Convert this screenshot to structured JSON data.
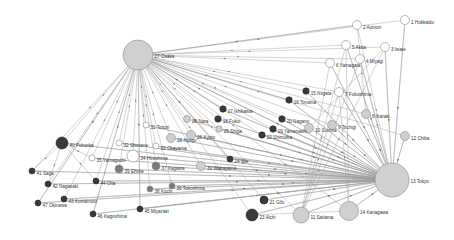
{
  "diagram": {
    "type": "network-graph",
    "colors": {
      "dark": "#3a3a3a",
      "medium": "#7a7a7a",
      "light": "#cfcfcf",
      "white": "#ffffff",
      "stroke": "#8a8a8a",
      "edge": "#9a9a9a"
    },
    "nodes": [
      {
        "id": 1,
        "label": "1 Hokkaido",
        "x": 405,
        "y": 20,
        "r": 4.5,
        "fill": "white"
      },
      {
        "id": 2,
        "label": "2 Aomori",
        "x": 357,
        "y": 25,
        "r": 4.5,
        "fill": "white"
      },
      {
        "id": 3,
        "label": "3 Iwate",
        "x": 385,
        "y": 47,
        "r": 4.5,
        "fill": "white"
      },
      {
        "id": 4,
        "label": "4 Miyagi",
        "x": 360,
        "y": 59,
        "r": 4.5,
        "fill": "white"
      },
      {
        "id": 5,
        "label": "5 Akita",
        "x": 346,
        "y": 45,
        "r": 4.5,
        "fill": "white"
      },
      {
        "id": 6,
        "label": "6 Yamagata",
        "x": 330,
        "y": 63,
        "r": 4.5,
        "fill": "white"
      },
      {
        "id": 7,
        "label": "7 Fukushima",
        "x": 339,
        "y": 92,
        "r": 4.5,
        "fill": "white"
      },
      {
        "id": 8,
        "label": "8 Ibaraki",
        "x": 366,
        "y": 114,
        "r": 4.5,
        "fill": "light"
      },
      {
        "id": 9,
        "label": "9 Tochigi",
        "x": 332,
        "y": 125,
        "r": 4.5,
        "fill": "light"
      },
      {
        "id": 10,
        "label": "10 Gunma",
        "x": 309,
        "y": 128,
        "r": 4.5,
        "fill": "light"
      },
      {
        "id": 11,
        "label": "11 Saitama",
        "x": 301,
        "y": 215,
        "r": 8,
        "fill": "light"
      },
      {
        "id": 12,
        "label": "12 Chiba",
        "x": 405,
        "y": 136,
        "r": 4.5,
        "fill": "light"
      },
      {
        "id": 13,
        "label": "13 Tokyo",
        "x": 392,
        "y": 180,
        "r": 17,
        "fill": "light"
      },
      {
        "id": 14,
        "label": "14 Kanagawa",
        "x": 349,
        "y": 211,
        "r": 9.5,
        "fill": "light"
      },
      {
        "id": 15,
        "label": "15 Niigata",
        "x": 306,
        "y": 91,
        "r": 3.2,
        "fill": "dark"
      },
      {
        "id": 16,
        "label": "16 Toyama",
        "x": 289,
        "y": 100,
        "r": 3.2,
        "fill": "dark"
      },
      {
        "id": 17,
        "label": "17 Ishikawa",
        "x": 223,
        "y": 109,
        "r": 3.2,
        "fill": "dark"
      },
      {
        "id": 18,
        "label": "18 Fukui",
        "x": 218,
        "y": 119,
        "r": 3.2,
        "fill": "dark"
      },
      {
        "id": 19,
        "label": "19 Yamanashi",
        "x": 273,
        "y": 129,
        "r": 3.2,
        "fill": "dark"
      },
      {
        "id": 20,
        "label": "20 Nagano",
        "x": 282,
        "y": 119,
        "r": 3.2,
        "fill": "dark"
      },
      {
        "id": 21,
        "label": "21 Gifu",
        "x": 264,
        "y": 200,
        "r": 4,
        "fill": "dark"
      },
      {
        "id": 22,
        "label": "22 Shizuoka",
        "x": 262,
        "y": 135,
        "r": 3.2,
        "fill": "dark"
      },
      {
        "id": 23,
        "label": "23 Aichi",
        "x": 252,
        "y": 215,
        "r": 6,
        "fill": "dark"
      },
      {
        "id": 24,
        "label": "24 Mie",
        "x": 230,
        "y": 159,
        "r": 3,
        "fill": "dark"
      },
      {
        "id": 25,
        "label": "25 Shiga",
        "x": 219,
        "y": 129,
        "r": 3.2,
        "fill": "light"
      },
      {
        "id": 26,
        "label": "26 Kyoto",
        "x": 191,
        "y": 135,
        "r": 4.5,
        "fill": "light"
      },
      {
        "id": 27,
        "label": "27 Osaka",
        "x": 138,
        "y": 55,
        "r": 15,
        "fill": "light"
      },
      {
        "id": 28,
        "label": "28 Hyogo",
        "x": 171,
        "y": 138,
        "r": 4.5,
        "fill": "light"
      },
      {
        "id": 29,
        "label": "29 Nara",
        "x": 187,
        "y": 119,
        "r": 3.5,
        "fill": "light"
      },
      {
        "id": 30,
        "label": "30 Wakayama",
        "x": 201,
        "y": 166,
        "r": 4.5,
        "fill": "light"
      },
      {
        "id": 31,
        "label": "31 Tottori",
        "x": 146,
        "y": 125,
        "r": 3,
        "fill": "white"
      },
      {
        "id": 32,
        "label": "32 Shimane",
        "x": 119,
        "y": 143,
        "r": 3,
        "fill": "white"
      },
      {
        "id": 33,
        "label": "33 Okayama",
        "x": 156,
        "y": 146,
        "r": 3,
        "fill": "white"
      },
      {
        "id": 34,
        "label": "34 Hiroshima",
        "x": 133,
        "y": 156,
        "r": 6,
        "fill": "white"
      },
      {
        "id": 35,
        "label": "35 Yamaguchi",
        "x": 92,
        "y": 158,
        "r": 3,
        "fill": "white"
      },
      {
        "id": 36,
        "label": "36 Tokushima",
        "x": 172,
        "y": 186,
        "r": 3,
        "fill": "medium"
      },
      {
        "id": 37,
        "label": "37 Kagawa",
        "x": 156,
        "y": 166,
        "r": 4,
        "fill": "medium"
      },
      {
        "id": 38,
        "label": "38 Kochi",
        "x": 150,
        "y": 189,
        "r": 3,
        "fill": "medium"
      },
      {
        "id": 39,
        "label": "39 Ehime",
        "x": 119,
        "y": 169,
        "r": 4,
        "fill": "medium"
      },
      {
        "id": 40,
        "label": "40 Fukuoka",
        "x": 62,
        "y": 143,
        "r": 6,
        "fill": "dark"
      },
      {
        "id": 41,
        "label": "41 Saga",
        "x": 32,
        "y": 171,
        "r": 3,
        "fill": "dark"
      },
      {
        "id": 42,
        "label": "42 Nagasaki",
        "x": 48,
        "y": 184,
        "r": 3,
        "fill": "dark"
      },
      {
        "id": 43,
        "label": "43 Kumamoto",
        "x": 64,
        "y": 199,
        "r": 3,
        "fill": "dark"
      },
      {
        "id": 44,
        "label": "44 Oita",
        "x": 96,
        "y": 181,
        "r": 3,
        "fill": "dark"
      },
      {
        "id": 45,
        "label": "45 Miyazaki",
        "x": 140,
        "y": 209,
        "r": 3,
        "fill": "dark"
      },
      {
        "id": 46,
        "label": "46 Kagoshima",
        "x": 93,
        "y": 214,
        "r": 3,
        "fill": "dark"
      },
      {
        "id": 47,
        "label": "47 Okinawa",
        "x": 38,
        "y": 203,
        "r": 3,
        "fill": "dark"
      }
    ],
    "hubs": [
      27,
      13
    ],
    "extra_edges": [
      [
        1,
        13
      ],
      [
        2,
        8
      ],
      [
        3,
        13
      ],
      [
        3,
        11
      ],
      [
        3,
        10
      ],
      [
        4,
        13
      ],
      [
        4,
        11
      ],
      [
        5,
        13
      ],
      [
        5,
        11
      ],
      [
        5,
        14
      ],
      [
        6,
        13
      ],
      [
        6,
        11
      ],
      [
        7,
        13
      ],
      [
        7,
        11
      ],
      [
        7,
        14
      ],
      [
        8,
        13
      ],
      [
        9,
        13
      ],
      [
        10,
        13
      ],
      [
        12,
        13
      ],
      [
        11,
        13
      ],
      [
        14,
        13
      ],
      [
        15,
        13
      ],
      [
        16,
        27
      ],
      [
        17,
        27
      ],
      [
        40,
        41
      ],
      [
        40,
        42
      ],
      [
        40,
        44
      ],
      [
        40,
        35
      ],
      [
        41,
        13
      ],
      [
        42,
        13
      ],
      [
        43,
        13
      ],
      [
        44,
        13
      ],
      [
        46,
        27
      ],
      [
        45,
        27
      ],
      [
        23,
        13
      ],
      [
        21,
        13
      ],
      [
        22,
        13
      ],
      [
        19,
        13
      ],
      [
        20,
        13
      ],
      [
        24,
        27
      ],
      [
        30,
        13
      ],
      [
        47,
        27
      ],
      [
        38,
        13
      ],
      [
        36,
        13
      ],
      [
        39,
        13
      ],
      [
        37,
        13
      ],
      [
        35,
        13
      ],
      [
        34,
        13
      ],
      [
        33,
        13
      ],
      [
        32,
        13
      ],
      [
        31,
        13
      ],
      [
        28,
        13
      ],
      [
        26,
        13
      ],
      [
        29,
        13
      ],
      [
        25,
        13
      ],
      [
        18,
        13
      ],
      [
        17,
        13
      ],
      [
        16,
        13
      ],
      [
        40,
        13
      ],
      [
        2,
        27
      ],
      [
        47,
        13
      ],
      [
        46,
        13
      ],
      [
        45,
        13
      ],
      [
        23,
        14
      ]
    ]
  }
}
